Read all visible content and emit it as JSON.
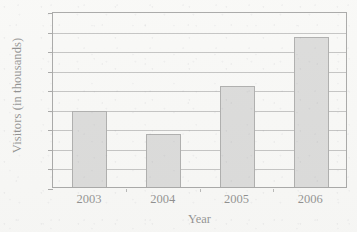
{
  "chart_data": {
    "type": "bar",
    "title": "",
    "categories": [
      "2003",
      "2004",
      "2005",
      "2006"
    ],
    "values": [
      758,
      734,
      783,
      833
    ],
    "series": [
      {
        "name": "Visitors",
        "values": [
          758,
          734,
          783,
          833
        ]
      }
    ],
    "xlabel": "Year",
    "ylabel": "Visitors (in thousands)",
    "ylim": [
      680,
      860
    ],
    "ytick_step": 20,
    "yticks": [
      860,
      840,
      820,
      800,
      780,
      760,
      740,
      720,
      700,
      680
    ],
    "ytick_labels": [
      "860",
      "840",
      "820",
      "800",
      "780",
      "760",
      "740",
      "720",
      "700",
      "680"
    ],
    "grid": true,
    "grid_axis": "y",
    "legend": false,
    "legend_position": "none",
    "bar_color": "#b9b9b9",
    "bar_edge_color": "#595959",
    "axis_color": "#4c4c4c",
    "gridline_color": "#878787",
    "background_color": "#f7f7f5"
  }
}
